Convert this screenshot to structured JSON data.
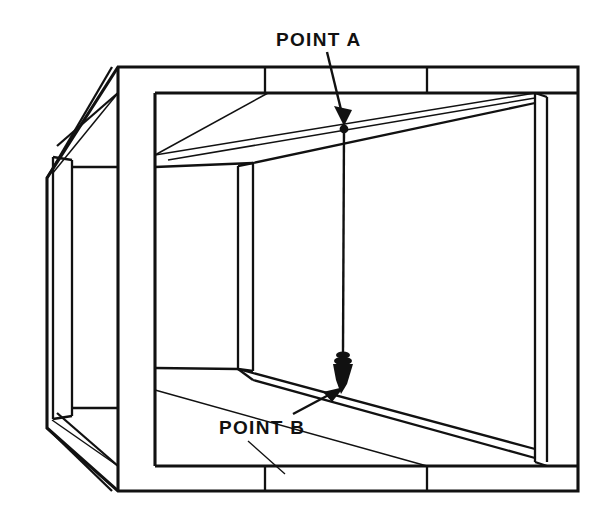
{
  "figure": {
    "type": "technical-line-drawing",
    "background_color": "#ffffff",
    "line_color": "#111111"
  },
  "callouts": [
    {
      "id": "point-a",
      "label": "POINT A",
      "text_x": 276,
      "text_y": 46,
      "description": "upper suspension point on ceiling where plumb line is attached",
      "leader": {
        "from_x": 327,
        "from_y": 52,
        "to_x": 344,
        "to_y": 122
      },
      "marker": {
        "x": 343,
        "y": 128,
        "r": 4
      }
    },
    {
      "id": "point-b",
      "label": "POINT B",
      "text_x": 219,
      "text_y": 434,
      "description": "lower target point on floor indicated by the plumb bob tip",
      "leader": {
        "from_x": 296,
        "from_y": 412,
        "to_x": 340,
        "to_y": 389
      },
      "reference_leader": {
        "from_x": 248,
        "from_y": 441,
        "to_x": 283,
        "to_y": 473
      }
    }
  ],
  "plumb_bob": {
    "name": "plumb-bob",
    "string_top_x": 344,
    "string_top_y": 128,
    "string_bottom_y": 352,
    "collar_y": 356,
    "tip_x": 341,
    "tip_y": 394,
    "fill": "#111111"
  },
  "colors": {
    "ink": "#111111",
    "paper": "#ffffff"
  }
}
